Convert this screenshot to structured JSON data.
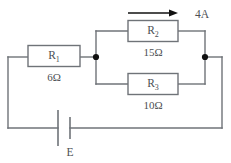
{
  "figure": {
    "type": "circuit-diagram",
    "title": "",
    "colors": {
      "wire": "#6f7378",
      "node": "#111111",
      "arrow": "#111111",
      "text": "#4c4f54",
      "background": "#ffffff"
    }
  },
  "components": {
    "r1": {
      "name": "R",
      "subscript": "1",
      "value": "6Ω",
      "resistance": 6,
      "unit": "Ω",
      "position": "series-left-branch"
    },
    "r2": {
      "name": "R",
      "subscript": "2",
      "value": "15Ω",
      "resistance": 15,
      "unit": "Ω",
      "position": "parallel-top-branch"
    },
    "r3": {
      "name": "R",
      "subscript": "3",
      "value": "10Ω",
      "resistance": 10,
      "unit": "Ω",
      "position": "parallel-bottom-branch"
    },
    "battery": {
      "label": "E",
      "position": "bottom-wire"
    }
  },
  "annotations": {
    "current": {
      "label": "4A",
      "magnitude": 4,
      "unit": "A",
      "direction": "right",
      "applies_to": "r2"
    }
  },
  "nodes": [
    {
      "id": "left-junction",
      "x": 96,
      "y": 57
    },
    {
      "id": "right-junction",
      "x": 205,
      "y": 57
    }
  ]
}
